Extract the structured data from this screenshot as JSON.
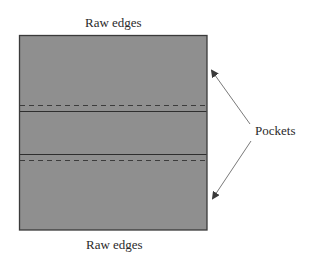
{
  "diagram": {
    "labels": {
      "top": "Raw edges",
      "bottom": "Raw edges",
      "pockets": "Pockets"
    },
    "colors": {
      "fabric_fill": "#8f8f8f",
      "border": "#3a3a3a",
      "fold_line": "#2e2e2e",
      "stitch_line": "#3c3c3c",
      "arrow": "#6a6a6a"
    },
    "panel": {
      "x": 19,
      "y": 35,
      "width": 188,
      "height": 195
    },
    "lines": [
      {
        "type": "stitch",
        "style": "dashed",
        "y": 105
      },
      {
        "type": "fold",
        "style": "solid",
        "y": 111
      },
      {
        "type": "fold",
        "style": "solid",
        "y": 154
      },
      {
        "type": "stitch",
        "style": "dashed",
        "y": 160
      }
    ],
    "arrows": [
      {
        "from": [
          250,
          124
        ],
        "to": [
          211,
          70
        ],
        "target": "upper-pocket"
      },
      {
        "from": [
          251,
          141
        ],
        "to": [
          212,
          199
        ],
        "target": "lower-pocket"
      }
    ]
  }
}
